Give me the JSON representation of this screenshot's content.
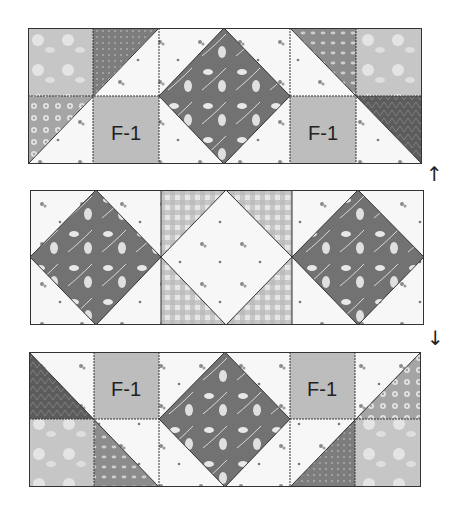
{
  "diagram": {
    "title": "",
    "rows": [
      {
        "id": "top-row",
        "labels": [
          "F-1",
          "F-1"
        ],
        "arrow": "↑"
      },
      {
        "id": "middle-row",
        "labels": [],
        "arrow": "↓"
      },
      {
        "id": "bottom-row",
        "labels": [
          "F-1",
          "F-1"
        ],
        "arrow": ""
      }
    ],
    "label_text": "F-1",
    "colors": {
      "dark_floral": "#6f6f6f",
      "medium_gray": "#8a8a8a",
      "light_gray": "#c9c9c9",
      "label_square": "#bdbdbd",
      "white_print": "#f6f6f6",
      "line": "#333333",
      "dark_print": "#5a5a5a"
    }
  }
}
